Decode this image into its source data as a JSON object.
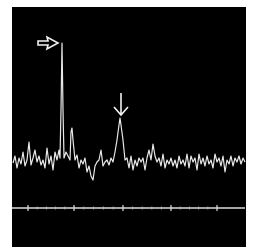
{
  "chart_data": {
    "type": "line",
    "title": "",
    "xlabel": "",
    "ylabel": "",
    "background": "#000000",
    "trace_color": "#e8e8e8",
    "grid": false,
    "legend": null,
    "frame": {
      "x": 12,
      "y": 7,
      "w": 234,
      "h": 240
    },
    "axis": {
      "y": 208,
      "x0": 12,
      "x1": 245,
      "major_ticks_x": [
        28,
        74,
        123,
        171,
        217
      ],
      "minor_ticks_per_gap": 4
    },
    "annotations": [
      {
        "type": "open-arrow-right",
        "x": 38,
        "y": 37,
        "w": 20,
        "h": 12,
        "points_to": "tall peak"
      },
      {
        "type": "arrow-down",
        "x": 121,
        "y": 93,
        "h": 22,
        "points_to": "secondary peak"
      }
    ],
    "series": [
      {
        "name": "spectrum",
        "points": [
          [
            13,
            163
          ],
          [
            15,
            156
          ],
          [
            17,
            168
          ],
          [
            19,
            158
          ],
          [
            21,
            164
          ],
          [
            23,
            152
          ],
          [
            25,
            166
          ],
          [
            27,
            160
          ],
          [
            29,
            142
          ],
          [
            31,
            165
          ],
          [
            33,
            158
          ],
          [
            35,
            150
          ],
          [
            37,
            162
          ],
          [
            39,
            156
          ],
          [
            41,
            165
          ],
          [
            43,
            160
          ],
          [
            45,
            168
          ],
          [
            47,
            148
          ],
          [
            49,
            164
          ],
          [
            51,
            156
          ],
          [
            53,
            170
          ],
          [
            55,
            152
          ],
          [
            57,
            160
          ],
          [
            59,
            150
          ],
          [
            60,
            158
          ],
          [
            61,
            110
          ],
          [
            62,
            43
          ],
          [
            63,
            110
          ],
          [
            64,
            158
          ],
          [
            66,
            152
          ],
          [
            68,
            156
          ],
          [
            70,
            160
          ],
          [
            71,
            132
          ],
          [
            72,
            128
          ],
          [
            73,
            140
          ],
          [
            75,
            160
          ],
          [
            77,
            155
          ],
          [
            79,
            168
          ],
          [
            81,
            160
          ],
          [
            83,
            164
          ],
          [
            85,
            158
          ],
          [
            87,
            172
          ],
          [
            89,
            166
          ],
          [
            91,
            176
          ],
          [
            93,
            180
          ],
          [
            95,
            166
          ],
          [
            97,
            162
          ],
          [
            99,
            160
          ],
          [
            101,
            150
          ],
          [
            103,
            166
          ],
          [
            105,
            162
          ],
          [
            107,
            160
          ],
          [
            109,
            165
          ],
          [
            111,
            158
          ],
          [
            113,
            162
          ],
          [
            115,
            152
          ],
          [
            117,
            140
          ],
          [
            119,
            125
          ],
          [
            120,
            118
          ],
          [
            121,
            125
          ],
          [
            123,
            140
          ],
          [
            125,
            160
          ],
          [
            127,
            158
          ],
          [
            129,
            168
          ],
          [
            131,
            156
          ],
          [
            133,
            170
          ],
          [
            135,
            160
          ],
          [
            137,
            166
          ],
          [
            139,
            158
          ],
          [
            141,
            162
          ],
          [
            143,
            158
          ],
          [
            145,
            170
          ],
          [
            147,
            158
          ],
          [
            149,
            150
          ],
          [
            151,
            160
          ],
          [
            153,
            144
          ],
          [
            155,
            156
          ],
          [
            157,
            162
          ],
          [
            159,
            158
          ],
          [
            161,
            166
          ],
          [
            163,
            154
          ],
          [
            165,
            168
          ],
          [
            167,
            160
          ],
          [
            169,
            164
          ],
          [
            171,
            158
          ],
          [
            173,
            166
          ],
          [
            175,
            160
          ],
          [
            177,
            168
          ],
          [
            179,
            156
          ],
          [
            181,
            164
          ],
          [
            183,
            160
          ],
          [
            185,
            166
          ],
          [
            187,
            154
          ],
          [
            189,
            168
          ],
          [
            191,
            156
          ],
          [
            193,
            162
          ],
          [
            195,
            158
          ],
          [
            197,
            170
          ],
          [
            199,
            154
          ],
          [
            201,
            164
          ],
          [
            203,
            158
          ],
          [
            205,
            166
          ],
          [
            207,
            156
          ],
          [
            209,
            164
          ],
          [
            211,
            160
          ],
          [
            213,
            168
          ],
          [
            215,
            154
          ],
          [
            217,
            162
          ],
          [
            219,
            158
          ],
          [
            221,
            166
          ],
          [
            223,
            156
          ],
          [
            225,
            172
          ],
          [
            227,
            160
          ],
          [
            229,
            164
          ],
          [
            231,
            156
          ],
          [
            233,
            166
          ],
          [
            235,
            158
          ],
          [
            237,
            162
          ],
          [
            239,
            156
          ],
          [
            241,
            164
          ],
          [
            243,
            158
          ],
          [
            245,
            162
          ]
        ]
      }
    ]
  }
}
